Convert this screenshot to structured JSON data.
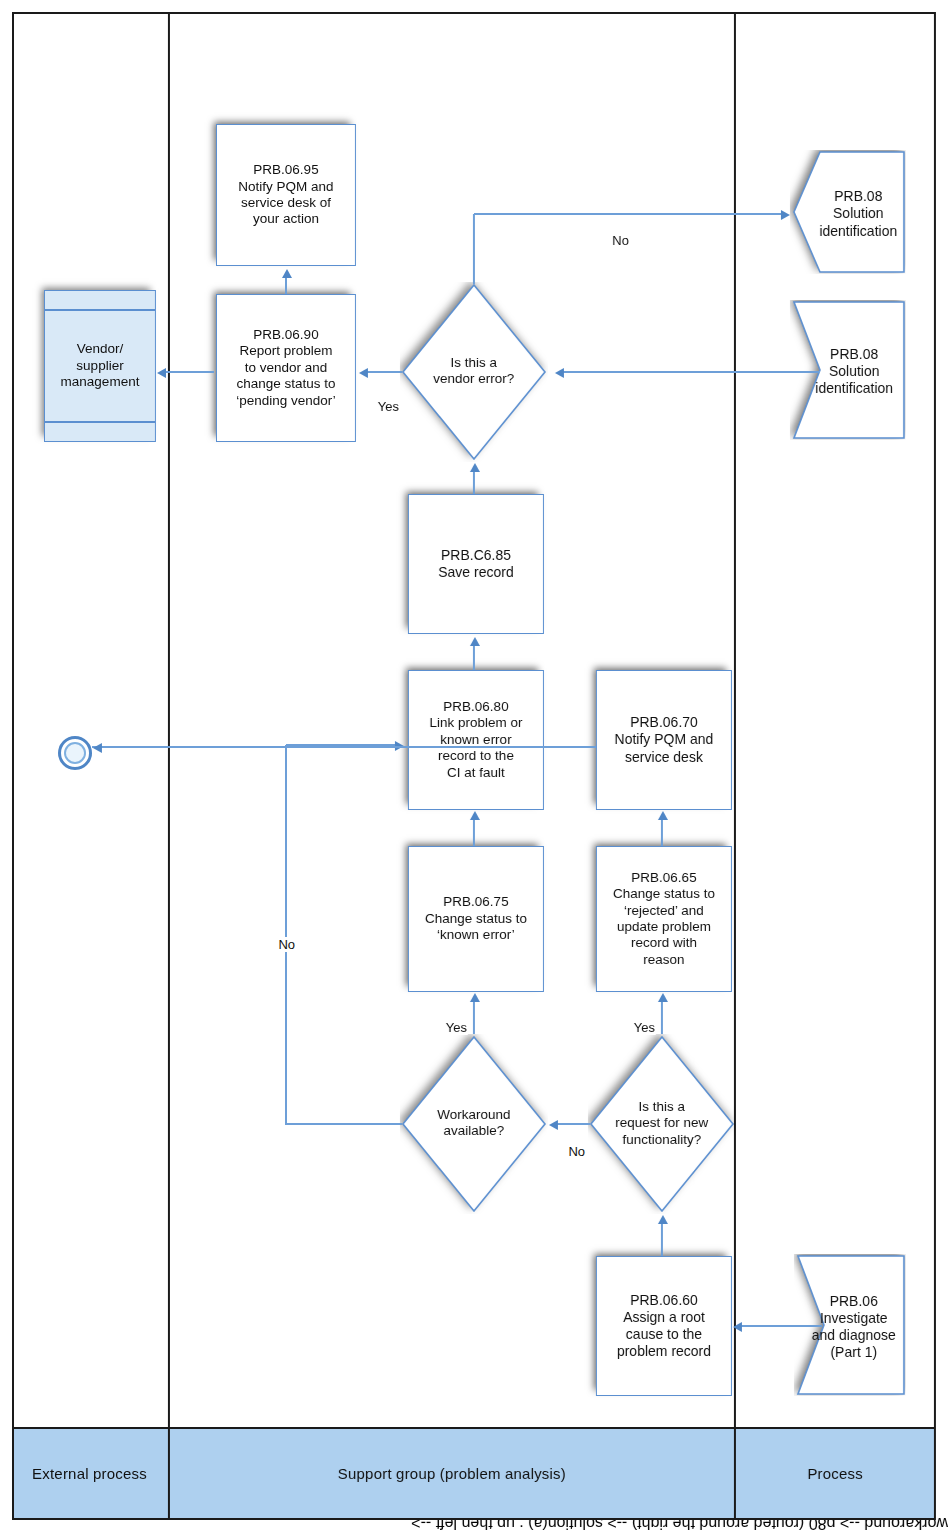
{
  "diagram": {
    "accent_color": "#5b8fd0",
    "lane_header_fill": "#aed0ef",
    "frame_color": "#1a1a1a"
  },
  "lanes": [
    {
      "id": "process",
      "label": "Process"
    },
    {
      "id": "support-group",
      "label": "Support group (problem analysis)"
    },
    {
      "id": "external",
      "label": "External process"
    }
  ],
  "nodes": {
    "offpage_solution_top": {
      "code": "PRB.08",
      "text": "Solution\nidentification",
      "shape": "pentagon"
    },
    "offpage_solution_bottom": {
      "code": "PRB.08",
      "text": "Solution\nidentification",
      "shape": "chevron"
    },
    "offpage_investigate": {
      "code": "PRB.06",
      "text": "Investigate\nand diagnose\n(Part 1)",
      "shape": "chevron"
    },
    "p60": {
      "code": "PRB.06.60",
      "text": "Assign a root\ncause to the\nproblem record"
    },
    "p65": {
      "code": "PRB.06.65",
      "text": "Change status to\n‘rejected’ and\nupdate problem\nrecord with\nreason"
    },
    "p70": {
      "code": "PRB.06.70",
      "text": "Notify PQM and\nservice desk"
    },
    "p75": {
      "code": "PRB.06.75",
      "text": "Change status to\n‘known error’"
    },
    "p80": {
      "code": "PRB.06.80",
      "text": "Link problem or\nknown error\nrecord to the\nCI at fault"
    },
    "p85": {
      "code": "PRB.C6.85",
      "text": "Save record"
    },
    "p90": {
      "code": "PRB.06.90",
      "text": "Report problem\nto vendor and\nchange status to\n‘pending vendor’"
    },
    "p95": {
      "code": "PRB.06.95",
      "text": "Notify PQM and\nservice desk of\nyour action"
    },
    "vendor_mgmt": {
      "text": "Vendor/\nsupplier\nmanagement",
      "shape": "predefined-process"
    },
    "end_terminator": {
      "text": "",
      "shape": "terminator"
    }
  },
  "decisions": {
    "d_new_functionality": {
      "text": "Is this a\nrequest for new\nfunctionality?"
    },
    "d_workaround": {
      "text": "Workaround\navailable?"
    },
    "d_vendor_error": {
      "text": "Is this a\nvendor error?"
    }
  },
  "edge_labels": {
    "new_func_yes": "Yes",
    "new_func_no": "No",
    "workaround_yes": "Yes",
    "workaround_no": "No",
    "vendor_yes": "Yes",
    "vendor_no": "No"
  }
}
